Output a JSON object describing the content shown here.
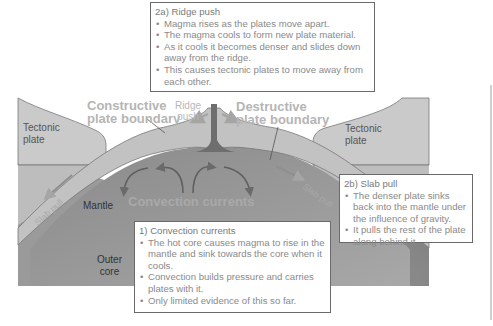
{
  "diagram": {
    "colors": {
      "plate": "#c9c9c9",
      "plate_outline": "#7a7a7a",
      "crust_band": "#bdbdbd",
      "mantle": "#8d8d8d",
      "mantle_light": "#b2b2b2",
      "box_border": "#6a6a6a",
      "box_text": "#8a8a8a",
      "heading_text": "#b5b5b5"
    },
    "labels": {
      "tectonic_plate_left": [
        "Tectonic",
        "plate"
      ],
      "tectonic_plate_right": [
        "Tectonic",
        "plate"
      ],
      "constructive": [
        "Constructive",
        "plate boundary"
      ],
      "destructive": [
        "Destructive",
        "plate boundary"
      ],
      "ridge_push": [
        "Ridge",
        "push"
      ],
      "mantle": "Mantle",
      "outer_core": [
        "Outer",
        "core"
      ],
      "convection_currents": "Convection currents",
      "slab_pull_left": "Slab pull",
      "slab_pull_right": "Slab pull"
    },
    "boxes": {
      "ridge_push": {
        "title": "2a) Ridge push",
        "bullets": [
          "Magma rises as the plates move apart.",
          "The magma cools to form new plate material.",
          "As it cools it becomes denser and slides down away from the ridge.",
          "This causes tectonic plates to move away from each other."
        ]
      },
      "slab_pull": {
        "title": "2b) Slab pull",
        "bullets": [
          "The denser plate sinks back into the mantle under the influence of gravity.",
          "It pulls the rest of the plate along behind it."
        ]
      },
      "convection": {
        "title": "1) Convection currents",
        "bullets": [
          "The hot core causes magma to rise in the mantle and sink towards the core when it cools.",
          "Convection builds pressure and carries plates with it.",
          "Only limited evidence of this so far."
        ]
      }
    }
  }
}
